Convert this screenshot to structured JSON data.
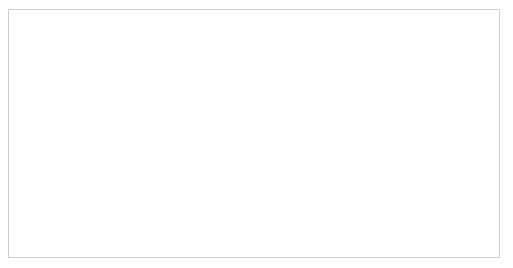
{
  "figure": {
    "axis_labels": {
      "x": "X",
      "z": "Z",
      "y_left": "Y",
      "y_right": "Y"
    },
    "arrows": [
      {
        "name": "x-axis-arrow",
        "direction": "up, out of tissue surface"
      },
      {
        "name": "z-axis-arrow",
        "direction": "curved toward upper right"
      },
      {
        "name": "y-axis-arrow-left",
        "direction": "upper right, tangent to tissue"
      },
      {
        "name": "y-axis-arrow-right",
        "direction": "upper left, tangent to tissue"
      }
    ],
    "tissue": {
      "parts": [
        "squamous-cell-layer",
        "basal-cell-row",
        "basement-membrane"
      ],
      "basal_cell_count": 13
    },
    "colors": {
      "background": "#ffffff",
      "frame_border": "#d6cdbb",
      "arrow": "#3d4a8f",
      "label_text": "#4a4a4a",
      "band_fill": "#fdecea",
      "squamous_fill": "#fbdfda",
      "squamous_outline": "#f0aca0",
      "basal_fill": "#f8cdbd",
      "basal_outline": "#e58b78",
      "nucleus_fill": "#cdd7ea",
      "nucleus_outline": "#5f6c9c",
      "membrane": "#a9bcdd",
      "membrane_dark": "#8fa6cf"
    }
  }
}
